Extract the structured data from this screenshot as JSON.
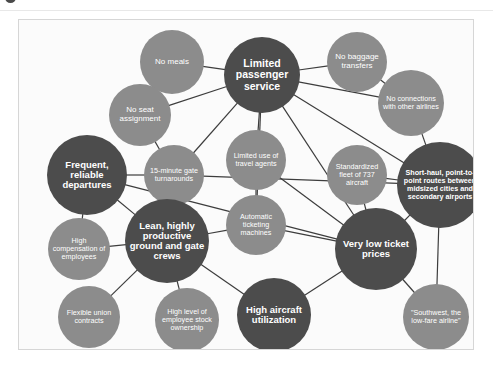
{
  "figure": {
    "panel_background": "#fbfbfb",
    "panel_border": "#d6d6d6",
    "dark_node_color": "#4c4c4c",
    "mid_node_color": "#8c8c8c",
    "link_color": "#3d3d3d",
    "node_text_color": "#ffffff"
  },
  "nodes": [
    {
      "id": "no-meals",
      "label": "No meals",
      "style": "mid",
      "cx": 153,
      "cy": 42,
      "r": 32,
      "size": "m"
    },
    {
      "id": "limited-passenger",
      "label": "Limited passenger service",
      "style": "dark",
      "cx": 243,
      "cy": 55,
      "r": 38,
      "size": "xl"
    },
    {
      "id": "no-baggage",
      "label": "No baggage transfers",
      "style": "mid",
      "cx": 338,
      "cy": 42,
      "r": 30,
      "size": "m"
    },
    {
      "id": "no-connections",
      "label": "No connections with other airlines",
      "style": "mid",
      "cx": 392,
      "cy": 83,
      "r": 33,
      "size": "s"
    },
    {
      "id": "no-seat",
      "label": "No seat assignment",
      "style": "mid",
      "cx": 121,
      "cy": 95,
      "r": 31,
      "size": "m"
    },
    {
      "id": "frequent-departures",
      "label": "Frequent, reliable departures",
      "style": "dark",
      "cx": 68,
      "cy": 155,
      "r": 40,
      "size": "l"
    },
    {
      "id": "gate-turnarounds",
      "label": "15-minute gate turnarounds",
      "style": "mid",
      "cx": 155,
      "cy": 155,
      "r": 30,
      "size": "s"
    },
    {
      "id": "travel-agents",
      "label": "Limited use of travel agents",
      "style": "mid",
      "cx": 237,
      "cy": 140,
      "r": 30,
      "size": "s"
    },
    {
      "id": "standardized-fleet",
      "label": "Standardized fleet of 737 aircraft",
      "style": "mid",
      "cx": 338,
      "cy": 155,
      "r": 30,
      "size": "s"
    },
    {
      "id": "short-haul",
      "label": "Short-haul, point-to-point routes between midsized cities and secondary airports",
      "style": "dark",
      "cx": 421,
      "cy": 165,
      "r": 43,
      "size": "s"
    },
    {
      "id": "high-compensation",
      "label": "High compensation of employees",
      "style": "mid",
      "cx": 60,
      "cy": 229,
      "r": 31,
      "size": "s"
    },
    {
      "id": "ticketing-machines",
      "label": "Automatic ticketing machines",
      "style": "mid",
      "cx": 237,
      "cy": 205,
      "r": 30,
      "size": "s"
    },
    {
      "id": "lean-crews",
      "label": "Lean, highly productive ground and gate crews",
      "style": "dark",
      "cx": 148,
      "cy": 221,
      "r": 42,
      "size": "l"
    },
    {
      "id": "very-low-prices",
      "label": "Very low ticket prices",
      "style": "dark",
      "cx": 357,
      "cy": 229,
      "r": 41,
      "size": "l"
    },
    {
      "id": "flexible-union",
      "label": "Flexible union contracts",
      "style": "mid",
      "cx": 70,
      "cy": 297,
      "r": 31,
      "size": "s"
    },
    {
      "id": "stock-ownership",
      "label": "High level of employee stock ownership",
      "style": "mid",
      "cx": 168,
      "cy": 300,
      "r": 32,
      "size": "s"
    },
    {
      "id": "aircraft-utilization",
      "label": "High aircraft utilization",
      "style": "dark",
      "cx": 255,
      "cy": 295,
      "r": 37,
      "size": "l"
    },
    {
      "id": "southwest-slogan",
      "label": "\"Southwest, the low-fare airline\"",
      "style": "mid",
      "cx": 417,
      "cy": 297,
      "r": 33,
      "size": "s"
    }
  ],
  "links": [
    [
      "no-meals",
      "limited-passenger"
    ],
    [
      "no-seat",
      "limited-passenger"
    ],
    [
      "no-baggage",
      "limited-passenger"
    ],
    [
      "no-connections",
      "limited-passenger"
    ],
    [
      "no-baggage",
      "no-connections"
    ],
    [
      "limited-passenger",
      "travel-agents"
    ],
    [
      "limited-passenger",
      "ticketing-machines"
    ],
    [
      "limited-passenger",
      "very-low-prices"
    ],
    [
      "limited-passenger",
      "short-haul"
    ],
    [
      "limited-passenger",
      "gate-turnarounds"
    ],
    [
      "no-connections",
      "short-haul"
    ],
    [
      "no-seat",
      "gate-turnarounds"
    ],
    [
      "frequent-departures",
      "gate-turnarounds"
    ],
    [
      "frequent-departures",
      "high-compensation"
    ],
    [
      "frequent-departures",
      "lean-crews"
    ],
    [
      "gate-turnarounds",
      "lean-crews"
    ],
    [
      "gate-turnarounds",
      "short-haul"
    ],
    [
      "travel-agents",
      "very-low-prices"
    ],
    [
      "ticketing-machines",
      "very-low-prices"
    ],
    [
      "travel-agents",
      "ticketing-machines"
    ],
    [
      "standardized-fleet",
      "very-low-prices"
    ],
    [
      "standardized-fleet",
      "short-haul"
    ],
    [
      "short-haul",
      "very-low-prices"
    ],
    [
      "short-haul",
      "southwest-slogan"
    ],
    [
      "lean-crews",
      "high-compensation"
    ],
    [
      "lean-crews",
      "flexible-union"
    ],
    [
      "lean-crews",
      "stock-ownership"
    ],
    [
      "lean-crews",
      "aircraft-utilization"
    ],
    [
      "lean-crews",
      "ticketing-machines"
    ],
    [
      "aircraft-utilization",
      "very-low-prices"
    ],
    [
      "very-low-prices",
      "southwest-slogan"
    ],
    [
      "frequent-departures",
      "very-low-prices"
    ]
  ]
}
